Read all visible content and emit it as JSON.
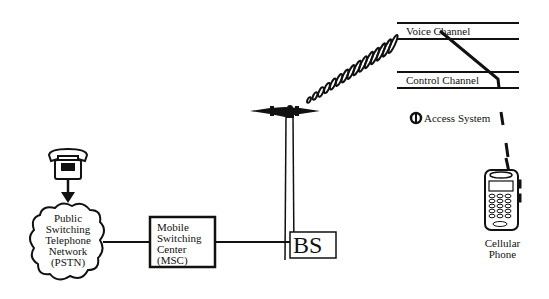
{
  "channels": {
    "voice": "Voice Channel",
    "control": "Control Channel",
    "access": "Access System"
  },
  "pstn": {
    "lines": [
      "Public",
      "Switching",
      "Telephone",
      "Network",
      "(PSTN)"
    ]
  },
  "msc": {
    "lines": [
      "Mobile",
      "Switching",
      "Center",
      "(MSC)"
    ]
  },
  "bs": {
    "label": "BS"
  },
  "phone": {
    "lines": [
      "Cellular",
      "Phone"
    ]
  }
}
